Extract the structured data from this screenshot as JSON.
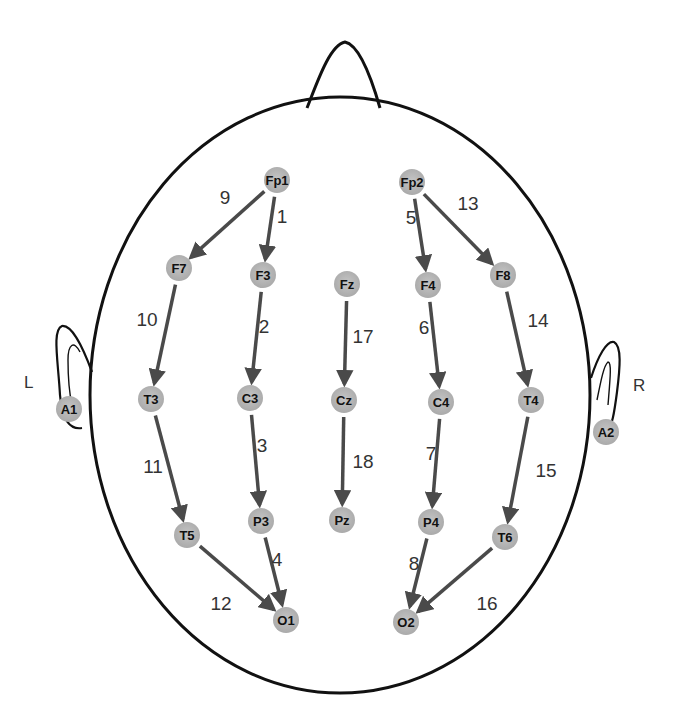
{
  "colors": {
    "outline": "#111111",
    "electrode_fill": "#b8b8b8",
    "arrow": "#4a4a4a",
    "label": "#333333"
  },
  "side_labels": {
    "left": "L",
    "right": "R"
  },
  "electrodes": [
    {
      "id": "Fp1",
      "x": 277,
      "y": 180
    },
    {
      "id": "Fp2",
      "x": 412,
      "y": 182
    },
    {
      "id": "F7",
      "x": 179,
      "y": 268
    },
    {
      "id": "F3",
      "x": 263,
      "y": 275
    },
    {
      "id": "Fz",
      "x": 347,
      "y": 284
    },
    {
      "id": "F4",
      "x": 428,
      "y": 285
    },
    {
      "id": "F8",
      "x": 503,
      "y": 275
    },
    {
      "id": "A1",
      "x": 69,
      "y": 409
    },
    {
      "id": "T3",
      "x": 151,
      "y": 399
    },
    {
      "id": "C3",
      "x": 250,
      "y": 398
    },
    {
      "id": "Cz",
      "x": 344,
      "y": 400
    },
    {
      "id": "C4",
      "x": 441,
      "y": 402
    },
    {
      "id": "T4",
      "x": 531,
      "y": 400
    },
    {
      "id": "A2",
      "x": 606,
      "y": 432
    },
    {
      "id": "T5",
      "x": 187,
      "y": 535
    },
    {
      "id": "P3",
      "x": 261,
      "y": 521
    },
    {
      "id": "Pz",
      "x": 342,
      "y": 520
    },
    {
      "id": "P4",
      "x": 431,
      "y": 522
    },
    {
      "id": "T6",
      "x": 505,
      "y": 537
    },
    {
      "id": "O1",
      "x": 286,
      "y": 620
    },
    {
      "id": "O2",
      "x": 406,
      "y": 622
    }
  ],
  "channels": [
    {
      "n": "1",
      "from": "Fp1",
      "to": "F3",
      "lx": 282,
      "ly": 223
    },
    {
      "n": "2",
      "from": "F3",
      "to": "C3",
      "lx": 264,
      "ly": 333
    },
    {
      "n": "3",
      "from": "C3",
      "to": "P3",
      "lx": 262,
      "ly": 452
    },
    {
      "n": "4",
      "from": "P3",
      "to": "O1",
      "lx": 277,
      "ly": 566
    },
    {
      "n": "5",
      "from": "Fp2",
      "to": "F4",
      "lx": 411,
      "ly": 224
    },
    {
      "n": "6",
      "from": "F4",
      "to": "C4",
      "lx": 424,
      "ly": 334
    },
    {
      "n": "7",
      "from": "C4",
      "to": "P4",
      "lx": 431,
      "ly": 460
    },
    {
      "n": "8",
      "from": "P4",
      "to": "O2",
      "lx": 414,
      "ly": 570
    },
    {
      "n": "9",
      "from": "Fp1",
      "to": "F7",
      "lx": 225,
      "ly": 204
    },
    {
      "n": "10",
      "from": "F7",
      "to": "T3",
      "lx": 147,
      "ly": 326
    },
    {
      "n": "11",
      "from": "T3",
      "to": "T5",
      "lx": 153,
      "ly": 473
    },
    {
      "n": "12",
      "from": "T5",
      "to": "O1",
      "lx": 221,
      "ly": 610
    },
    {
      "n": "13",
      "from": "Fp2",
      "to": "F8",
      "lx": 468,
      "ly": 210
    },
    {
      "n": "14",
      "from": "F8",
      "to": "T4",
      "lx": 538,
      "ly": 327
    },
    {
      "n": "15",
      "from": "T4",
      "to": "T6",
      "lx": 546,
      "ly": 477
    },
    {
      "n": "16",
      "from": "T6",
      "to": "O2",
      "lx": 487,
      "ly": 610
    },
    {
      "n": "17",
      "from": "Fz",
      "to": "Cz",
      "lx": 363,
      "ly": 343
    },
    {
      "n": "18",
      "from": "Cz",
      "to": "Pz",
      "lx": 363,
      "ly": 468
    }
  ]
}
